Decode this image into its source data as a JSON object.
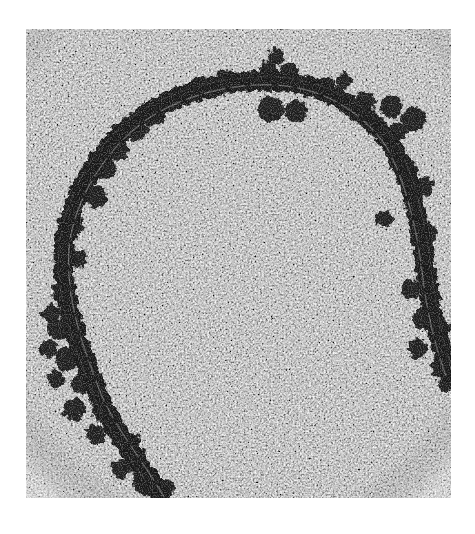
{
  "figure": {
    "type": "electron-micrograph",
    "colors": {
      "background_page": "#ffffff",
      "filament": "#141414",
      "clusters": "#1a1a1a",
      "field_base": "#9a9a9a"
    }
  }
}
